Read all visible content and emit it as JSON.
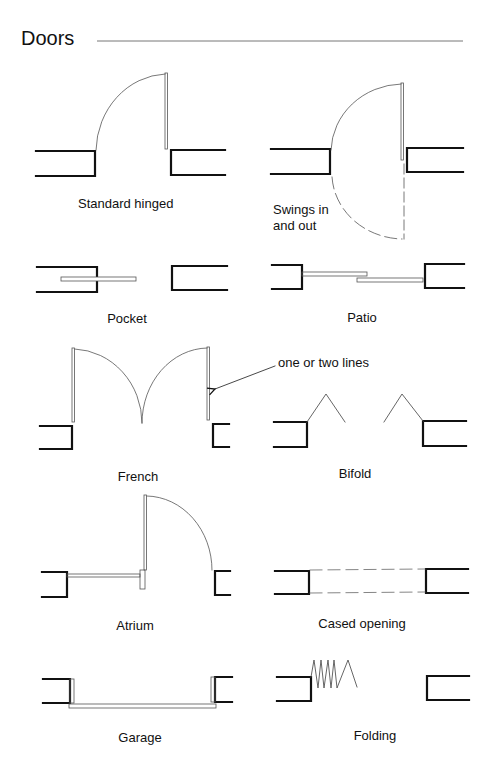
{
  "page": {
    "title": "Doors",
    "colors": {
      "wall": "#111111",
      "door": "#555555",
      "text": "#111111",
      "rule": "#777777"
    }
  },
  "symbols": [
    {
      "id": "standard-hinged",
      "label": "Standard hinged"
    },
    {
      "id": "swings-in-and-out",
      "label_line1": "Swings in",
      "label_line2": "and out"
    },
    {
      "id": "pocket",
      "label": "Pocket"
    },
    {
      "id": "patio",
      "label": "Patio"
    },
    {
      "id": "french",
      "label": "French"
    },
    {
      "id": "bifold",
      "label": "Bifold"
    },
    {
      "id": "atrium",
      "label": "Atrium"
    },
    {
      "id": "cased-opening",
      "label": "Cased opening"
    },
    {
      "id": "garage",
      "label": "Garage"
    },
    {
      "id": "folding",
      "label": "Folding"
    }
  ],
  "annotation": {
    "text": "one or two lines"
  }
}
